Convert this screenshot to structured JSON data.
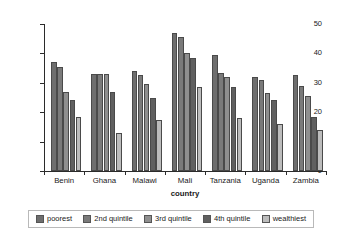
{
  "chart_data": {
    "type": "bar",
    "title": "",
    "xlabel": "country",
    "ylabel": "% underweight prevalence",
    "categories": [
      "Benin",
      "Ghana",
      "Malawi",
      "Mali",
      "Tanzania",
      "Uganda",
      "Zambia"
    ],
    "ylim": [
      0,
      50
    ],
    "yticks": [
      0,
      10,
      20,
      30,
      40,
      50
    ],
    "grid": false,
    "legend_position": "bottom",
    "series": [
      {
        "name": "poorest",
        "color": "#6e6e6e",
        "values": [
          37.0,
          33.0,
          34.0,
          47.0,
          39.5,
          32.0,
          32.5
        ]
      },
      {
        "name": "2nd quintile",
        "color": "#7a7a7a",
        "values": [
          35.5,
          33.0,
          32.5,
          45.5,
          33.5,
          31.0,
          29.0
        ]
      },
      {
        "name": "3rd quintile",
        "color": "#8f8f8f",
        "values": [
          27.0,
          33.0,
          29.5,
          40.0,
          32.0,
          26.5,
          25.5
        ]
      },
      {
        "name": "4th quintile",
        "color": "#606060",
        "values": [
          24.0,
          27.0,
          25.0,
          38.5,
          28.5,
          24.0,
          18.5
        ]
      },
      {
        "name": "wealthiest",
        "color": "#bcbcbc",
        "values": [
          18.5,
          13.0,
          17.5,
          28.5,
          18.0,
          16.0,
          14.0
        ]
      }
    ]
  },
  "legend": {
    "items": [
      {
        "label": "poorest"
      },
      {
        "label": "2nd quintile"
      },
      {
        "label": "3rd quintile"
      },
      {
        "label": "4th quintile"
      },
      {
        "label": "wealthiest"
      }
    ]
  }
}
